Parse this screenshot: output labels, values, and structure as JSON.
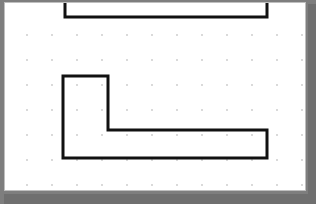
{
  "canvas": {
    "title": "Drawing Canvas",
    "background_color": "#ffffff",
    "border_color": "#bfbfbf",
    "surround_color": "#7e7e7e",
    "width": 302,
    "height": 189
  },
  "grid": {
    "name": "dot-grid",
    "dot_color": "#c8c8c8",
    "spacing_x": 25,
    "spacing_y": 25,
    "origin_x": 22,
    "origin_y": 32,
    "columns": 12,
    "rows": 7,
    "dot_radius": 0.9
  },
  "drawing": {
    "stroke_color": "#111111",
    "stroke_width": 3,
    "shapes": [
      {
        "name": "open-rectangle-top",
        "type": "polyline",
        "closed": false,
        "description": "Partial rectangle open at the top edge, clipped by the canvas top",
        "points": "60,-6 60,14 262,14 262,-6"
      },
      {
        "name": "l-shape-polygon",
        "type": "polygon",
        "closed": true,
        "description": "L-shaped closed polygon with vertical arm at left and horizontal arm extending right",
        "points": "58,73 103,73 103,127 262,127 262,155 58,155"
      }
    ]
  }
}
